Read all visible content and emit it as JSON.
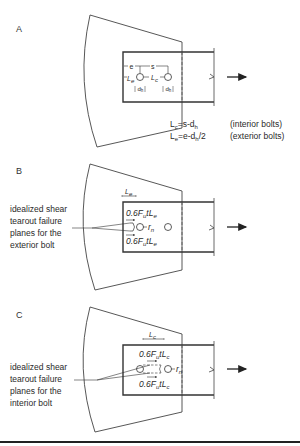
{
  "panels": [
    {
      "id": "A",
      "label": "A",
      "dims": {
        "e": "e",
        "s": "s",
        "Le": "L",
        "Le_sub": "e",
        "Lc": "L",
        "Lc_sub": "c",
        "dh": "d",
        "dh_sub": "h"
      },
      "equations": [
        {
          "lhs": "L",
          "lhs_sub": "c",
          "rhs": "=s-d",
          "rhs_sub": "h",
          "rhs_tail": "",
          "note": "(interior bolts)"
        },
        {
          "lhs": "L",
          "lhs_sub": "e",
          "rhs": "=e-d",
          "rhs_sub": "h",
          "rhs_tail": "/2",
          "note": "(exterior bolts)"
        }
      ]
    },
    {
      "id": "B",
      "label": "B",
      "dim_label": "L",
      "dim_sub": "e",
      "force_top": {
        "pre": "0.6F",
        "sub": "u",
        "mid": "tL",
        "sub2": "e"
      },
      "force_bottom": {
        "pre": "0.6F",
        "sub": "u",
        "mid": "tL",
        "sub2": "e"
      },
      "rn": "r",
      "rn_sub": "n",
      "callout": [
        "idealized shear",
        "tearout failure",
        "planes for the",
        "exterior bolt"
      ]
    },
    {
      "id": "C",
      "label": "C",
      "dim_label": "L",
      "dim_sub": "c",
      "force_top": {
        "pre": "0.6F",
        "sub": "u",
        "mid": "tL",
        "sub2": "c"
      },
      "force_bottom": {
        "pre": "0.6F",
        "sub": "u",
        "mid": "tL",
        "sub2": "c"
      },
      "rn": "r",
      "rn_sub": "n",
      "callout": [
        "idealized shear",
        "tearout failure",
        "planes for the",
        "interior bolt"
      ]
    }
  ],
  "colors": {
    "line": "#3a3a3a",
    "text": "#2a2a2a",
    "rule": "#222222"
  }
}
